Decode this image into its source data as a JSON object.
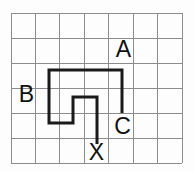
{
  "figure": {
    "background_color": "#fdfdfd",
    "grid": {
      "columns": 7,
      "rows": 6,
      "origin_x": 11,
      "origin_y": 13,
      "cell_width": 24.43,
      "cell_height": 25,
      "line_color": "#8c8c8c",
      "line_width": 1
    },
    "route": {
      "color": "#1a1a1a",
      "stroke_width": 3,
      "start_label": "C",
      "end_label": "X",
      "points": [
        [
          122,
          113
        ],
        [
          122,
          70
        ],
        [
          49,
          70
        ],
        [
          49,
          123
        ],
        [
          73,
          123
        ],
        [
          73,
          97
        ],
        [
          97,
          97
        ],
        [
          97,
          144
        ]
      ]
    },
    "labels": [
      {
        "id": "A",
        "text": "A",
        "x": 123.5,
        "baseline_y": 57
      },
      {
        "id": "B",
        "text": "B",
        "x": 26.5,
        "baseline_y": 102
      },
      {
        "id": "C",
        "text": "C",
        "x": 122.5,
        "baseline_y": 133.5
      },
      {
        "id": "X",
        "text": "X",
        "x": 96.5,
        "baseline_y": 160
      }
    ],
    "label_font_size": 23,
    "label_color": "#111111"
  }
}
